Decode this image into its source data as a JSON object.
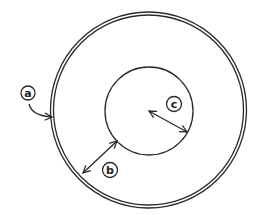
{
  "diagram": {
    "title": "",
    "stroke_color": "#2a2a2a",
    "background": "#ffffff",
    "shapes": {
      "outer_circle": {
        "cx": 148.5,
        "cy": 110,
        "r_outer": 98,
        "r_inner": 95,
        "style": "double-line"
      },
      "inner_circle": {
        "cx": 149,
        "cy": 111,
        "r": 44
      }
    },
    "labels": [
      {
        "id": "a",
        "text": "a",
        "x": 28,
        "y": 93,
        "points_to": "outer circle wall (double line)"
      },
      {
        "id": "b",
        "text": "b",
        "x": 110,
        "y": 170,
        "points_to": "gap between inner and outer circle"
      },
      {
        "id": "c",
        "text": "c",
        "x": 174,
        "y": 104,
        "points_to": "radius of inner circle"
      }
    ]
  }
}
